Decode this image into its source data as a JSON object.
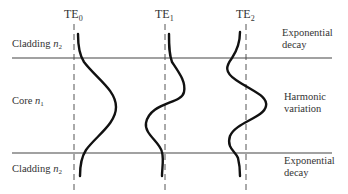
{
  "diagram": {
    "modes": [
      {
        "name": "TE",
        "subscript": "0"
      },
      {
        "name": "TE",
        "subscript": "1"
      },
      {
        "name": "TE",
        "subscript": "2"
      }
    ],
    "regions": {
      "top_cladding": {
        "label": "Cladding ",
        "index_symbol": "n",
        "index_sub": "2"
      },
      "core": {
        "label": "Core ",
        "index_symbol": "n",
        "index_sub": "1"
      },
      "bottom_cladding": {
        "label": "Cladding ",
        "index_symbol": "n",
        "index_sub": "2"
      }
    },
    "annotations": {
      "top": {
        "line1": "Exponential",
        "line2": "decay"
      },
      "middle": {
        "line1": "Harmonic",
        "line2": "variation"
      },
      "bottom": {
        "line1": "Exponential",
        "line2": "decay"
      }
    },
    "colors": {
      "curve": "#111111",
      "boundary": "#444444",
      "axis": "#555555",
      "text": "#333333"
    }
  }
}
